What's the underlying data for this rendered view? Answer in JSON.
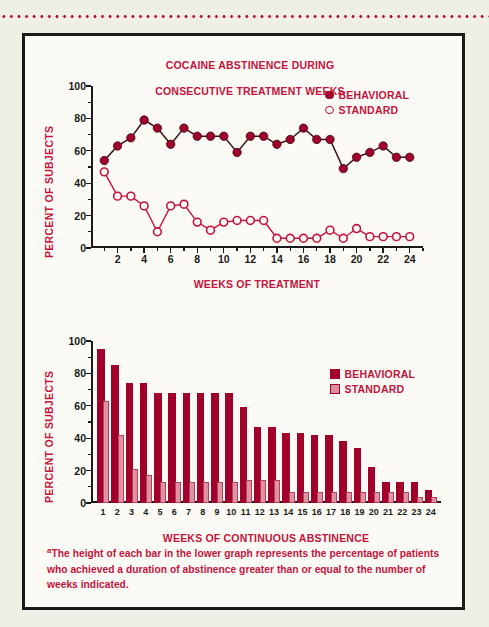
{
  "figure": {
    "footnote_marker": "a",
    "footnote_text": "The height of each bar in the lower graph represents the percentage of patients who achieved a duration of abstinence greater than or equal to the number of weeks indicated."
  },
  "colors": {
    "behavioral": "#a1002b",
    "standard_fill": "#dd93a2",
    "standard_line": "#c4133c",
    "title_red": "#c4133c",
    "axis_black": "#1a1a1a",
    "page_background": "#efefe6",
    "panel_background": "#fbfaf4"
  },
  "line_chart": {
    "title_line1": "COCAINE ABSTINENCE DURING",
    "title_line2": "CONSECUTIVE TREATMENT WEEKS",
    "legend": [
      {
        "label": "BEHAVIORAL",
        "marker": "filled-circle-icon"
      },
      {
        "label": "STANDARD",
        "marker": "open-circle-icon"
      }
    ]
  },
  "bar_chart": {
    "legend": [
      {
        "label": "BEHAVIORAL",
        "marker": "filled-square-icon"
      },
      {
        "label": "STANDARD",
        "marker": "open-square-icon"
      }
    ]
  },
  "chart_data": [
    {
      "type": "line",
      "title": "COCAINE ABSTINENCE DURING CONSECUTIVE TREATMENT WEEKS",
      "xlabel": "WEEKS OF TREATMENT",
      "ylabel": "PERCENT OF SUBJECTS",
      "xlim": [
        0,
        25
      ],
      "ylim": [
        0,
        100
      ],
      "yticks": [
        0,
        20,
        40,
        60,
        80,
        100
      ],
      "ytick_labels": [
        "0",
        "20",
        "40",
        "60",
        "80",
        "100"
      ],
      "xticks": [
        2,
        4,
        6,
        8,
        10,
        12,
        14,
        16,
        18,
        20,
        22,
        24
      ],
      "xtick_labels": [
        "2",
        "4",
        "6",
        "8",
        "10",
        "12",
        "14",
        "16",
        "18",
        "20",
        "22",
        "24"
      ],
      "grid": false,
      "legend_position": "top-right",
      "x": [
        1,
        2,
        3,
        4,
        5,
        6,
        7,
        8,
        9,
        10,
        11,
        12,
        13,
        14,
        15,
        16,
        17,
        18,
        19,
        20,
        21,
        22,
        23,
        24
      ],
      "series": [
        {
          "name": "BEHAVIORAL",
          "marker": "filled-circle",
          "values": [
            54,
            63,
            68,
            79,
            74,
            64,
            74,
            69,
            69,
            69,
            59,
            69,
            69,
            64,
            67,
            74,
            67,
            67,
            49,
            56,
            59,
            63,
            56,
            56
          ]
        },
        {
          "name": "STANDARD",
          "marker": "open-circle",
          "values": [
            47,
            32,
            32,
            26,
            10,
            26,
            27,
            16,
            11,
            16,
            17,
            17,
            17,
            6,
            6,
            6,
            6,
            11,
            6,
            12,
            7,
            7,
            7,
            7
          ]
        }
      ]
    },
    {
      "type": "bar",
      "title": "",
      "xlabel": "WEEKS OF CONTINUOUS ABSTINENCE",
      "ylabel": "PERCENT OF SUBJECTS",
      "ylim": [
        0,
        100
      ],
      "yticks": [
        0,
        20,
        40,
        60,
        80,
        100
      ],
      "ytick_labels": [
        "0",
        "20",
        "40",
        "60",
        "80",
        "100"
      ],
      "grid": false,
      "legend_position": "top-right",
      "categories": [
        "1",
        "2",
        "3",
        "4",
        "5",
        "6",
        "7",
        "8",
        "9",
        "10",
        "11",
        "12",
        "13",
        "14",
        "15",
        "16",
        "17",
        "18",
        "19",
        "20",
        "21",
        "22",
        "23",
        "24"
      ],
      "series": [
        {
          "name": "BEHAVIORAL",
          "values": [
            95,
            85,
            74,
            74,
            68,
            68,
            68,
            68,
            68,
            68,
            59,
            47,
            47,
            43,
            43,
            42,
            42,
            38,
            34,
            22,
            13,
            13,
            13,
            8
          ]
        },
        {
          "name": "STANDARD",
          "values": [
            63,
            42,
            21,
            17,
            13,
            13,
            13,
            13,
            13,
            13,
            14,
            14,
            14,
            7,
            7,
            7,
            7,
            7,
            7,
            7,
            7,
            7,
            4,
            4
          ]
        }
      ]
    }
  ]
}
